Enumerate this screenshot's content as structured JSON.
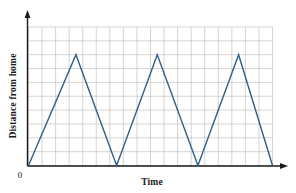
{
  "figure": {
    "name": "distance-time-graph",
    "background_color": "#ffffff"
  },
  "labels": {
    "ylabel": "Distance from home",
    "xlabel": "Time",
    "origin": "0"
  },
  "style": {
    "line_color": "#2f5f8a",
    "grid_color": "#b9b9b9",
    "axis_color": "#1a1a1a",
    "line_width": 1.4,
    "grid_width": 0.6
  },
  "chart_data": {
    "type": "line",
    "title": "",
    "xlabel": "Time",
    "ylabel": "Distance from home",
    "xlim": [
      0,
      18
    ],
    "ylim": [
      0,
      10
    ],
    "grid": true,
    "legend": "none",
    "x_tick_labels": [],
    "y_tick_labels": [],
    "origin_label": "0",
    "series": [
      {
        "name": "Distance from home",
        "color": "#2f5f8a",
        "x": [
          0,
          3.5,
          6.5,
          9.5,
          12.5,
          15.5,
          18
        ],
        "y": [
          0,
          8,
          0,
          8,
          0,
          8,
          0
        ]
      }
    ],
    "peaks": [
      {
        "x": 3.5,
        "y": 8
      },
      {
        "x": 9.5,
        "y": 8
      },
      {
        "x": 15.5,
        "y": 8
      }
    ],
    "valleys": [
      {
        "x": 0,
        "y": 0
      },
      {
        "x": 6.5,
        "y": 0
      },
      {
        "x": 12.5,
        "y": 0
      },
      {
        "x": 18,
        "y": 0
      }
    ],
    "grid_columns": 18,
    "grid_rows": 10
  }
}
